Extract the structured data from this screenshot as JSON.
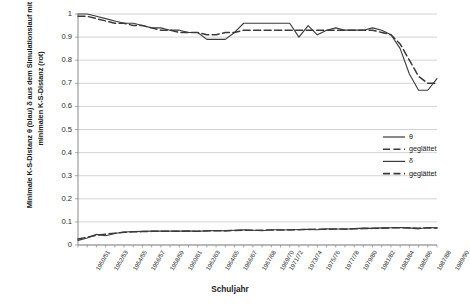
{
  "chart_data": {
    "type": "line",
    "title": "",
    "xlabel": "Schuljahr",
    "ylabel": "Minimale K-S-Distanz θ (blau) δ aus dem Simulationslauf mit der minimalen K-S-Distanz (rot)",
    "ylim": [
      0,
      1
    ],
    "yticks": [
      "0",
      "0.1",
      "0.2",
      "0.3",
      "0.4",
      "0.5",
      "0.6",
      "0.7",
      "0.8",
      "0.9",
      "1"
    ],
    "grid": true,
    "legend_position": "right-middle",
    "categories": [
      "1950/51",
      "1951/52",
      "1952/53",
      "1953/54",
      "1954/55",
      "1955/56",
      "1956/57",
      "1957/58",
      "1958/59",
      "1959/60",
      "1960/61",
      "1961/62",
      "1962/63",
      "1963/64",
      "1964/65",
      "1965/66",
      "1966/67",
      "1967/68",
      "1968/69",
      "1969/70",
      "1970/71",
      "1971/72",
      "1972/73",
      "1973/74",
      "1974/75",
      "1975/76",
      "1976/77",
      "1977/78",
      "1978/79",
      "1979/80",
      "1980/81",
      "1981/82",
      "1982/83",
      "1983/84",
      "1984/85",
      "1985/86",
      "1986/87",
      "1987/88",
      "1988/89",
      "1989/90"
    ],
    "xtick_labels": [
      "1950/51",
      "1952/53",
      "1954/55",
      "1956/57",
      "1958/59",
      "1960/61",
      "1962/63",
      "1964/65",
      "1966/67",
      "1967/68",
      "1969/70",
      "1971/72",
      "1973/74",
      "1975/76",
      "1977/78",
      "1979/80",
      "1981/82",
      "1983/84",
      "1985/86",
      "1987/88",
      "1989/90"
    ],
    "series": [
      {
        "name": "θ",
        "style": "solid",
        "color": "#3a3a3a",
        "values": [
          1.0,
          1.0,
          0.99,
          0.98,
          0.97,
          0.96,
          0.96,
          0.95,
          0.94,
          0.94,
          0.93,
          0.93,
          0.92,
          0.92,
          0.89,
          0.89,
          0.89,
          0.92,
          0.96,
          0.96,
          0.96,
          0.96,
          0.96,
          0.96,
          0.9,
          0.95,
          0.91,
          0.93,
          0.94,
          0.93,
          0.93,
          0.93,
          0.94,
          0.93,
          0.91,
          0.85,
          0.74,
          0.67,
          0.67,
          0.72
        ]
      },
      {
        "name": "geglättet",
        "style": "dashed",
        "color": "#3a3a3a",
        "values": [
          0.99,
          0.99,
          0.98,
          0.97,
          0.96,
          0.96,
          0.95,
          0.95,
          0.94,
          0.93,
          0.93,
          0.92,
          0.92,
          0.92,
          0.91,
          0.91,
          0.92,
          0.92,
          0.93,
          0.93,
          0.93,
          0.93,
          0.93,
          0.93,
          0.93,
          0.93,
          0.93,
          0.93,
          0.93,
          0.93,
          0.93,
          0.93,
          0.93,
          0.92,
          0.91,
          0.87,
          0.8,
          0.73,
          0.7,
          0.7
        ]
      },
      {
        "name": "δ",
        "style": "solid",
        "color": "#3a3a3a",
        "values": [
          0.02,
          0.03,
          0.046,
          0.04,
          0.05,
          0.056,
          0.058,
          0.059,
          0.06,
          0.06,
          0.06,
          0.06,
          0.061,
          0.059,
          0.062,
          0.063,
          0.061,
          0.064,
          0.066,
          0.064,
          0.062,
          0.066,
          0.066,
          0.065,
          0.067,
          0.068,
          0.066,
          0.07,
          0.069,
          0.068,
          0.071,
          0.073,
          0.072,
          0.074,
          0.075,
          0.076,
          0.074,
          0.07,
          0.076,
          0.074
        ]
      },
      {
        "name": "geglättet",
        "style": "dashed",
        "color": "#3a3a3a",
        "values": [
          0.026,
          0.034,
          0.042,
          0.047,
          0.051,
          0.055,
          0.057,
          0.058,
          0.059,
          0.06,
          0.06,
          0.06,
          0.06,
          0.06,
          0.061,
          0.062,
          0.062,
          0.063,
          0.064,
          0.064,
          0.064,
          0.065,
          0.065,
          0.066,
          0.066,
          0.067,
          0.068,
          0.068,
          0.069,
          0.069,
          0.07,
          0.071,
          0.072,
          0.073,
          0.074,
          0.075,
          0.074,
          0.073,
          0.074,
          0.074
        ]
      }
    ]
  },
  "legend": {
    "items": [
      {
        "label": "θ"
      },
      {
        "label": "geglättet"
      },
      {
        "label": "δ"
      },
      {
        "label": "geglättet"
      }
    ]
  }
}
